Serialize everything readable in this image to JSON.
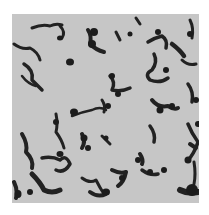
{
  "image": {
    "kind": "grayscale micrograph",
    "subject": "scattered rod-shaped and chain-forming cells on light background",
    "background_color": "#c6c6c6",
    "cell_color": "#1e1e1e"
  }
}
